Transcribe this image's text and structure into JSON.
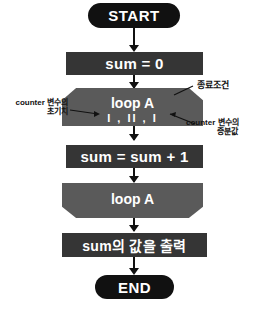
{
  "diagram": {
    "background_color": "#ffffff",
    "terminal_color": "#111111",
    "process_color": "#353535",
    "loop_color": "#5a5a5a",
    "text_color": "#ffffff",
    "annotation_color": "#111111"
  },
  "nodes": {
    "start": {
      "label": "START",
      "type": "terminal"
    },
    "init_sum": {
      "label": "sum = 0",
      "type": "process"
    },
    "loop_start": {
      "label": "loop A",
      "params": "I , II , I",
      "type": "loop-start"
    },
    "accumulate": {
      "label": "sum = sum + 1",
      "type": "process"
    },
    "loop_end": {
      "label": "loop A",
      "type": "loop-end"
    },
    "output": {
      "label": "sum의 값을 출력",
      "type": "process"
    },
    "end": {
      "label": "END",
      "type": "terminal"
    }
  },
  "annotations": {
    "init_value": {
      "line1": "counter 변수의",
      "line2": "초기치"
    },
    "termination": {
      "line1": "종료조건"
    },
    "increment": {
      "line1": "counter 변수의",
      "line2": "증분값"
    }
  },
  "caption": {
    "text": ""
  }
}
